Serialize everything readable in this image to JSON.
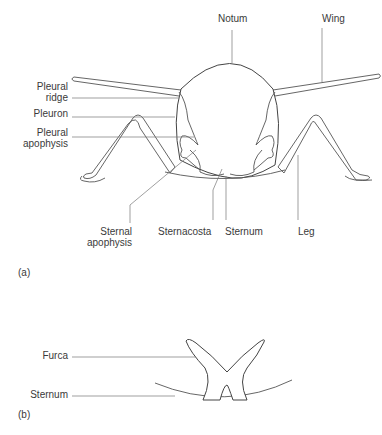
{
  "figure_a": {
    "panel_label": "(a)",
    "labels": {
      "notum": "Notum",
      "wing": "Wing",
      "pleural_ridge_1": "Pleural",
      "pleural_ridge_2": "ridge",
      "pleuron": "Pleuron",
      "pleural_apophysis_1": "Pleural",
      "pleural_apophysis_2": "apophysis",
      "sternal_apophysis_1": "Sternal",
      "sternal_apophysis_2": "apophysis",
      "sternacosta": "Sternacosta",
      "sternum": "Sternum",
      "leg": "Leg"
    }
  },
  "figure_b": {
    "panel_label": "(b)",
    "labels": {
      "furca": "Furca",
      "sternum": "Sternum"
    }
  }
}
